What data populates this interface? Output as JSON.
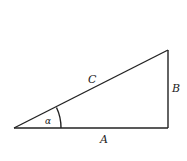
{
  "diagram": {
    "type": "right-triangle",
    "labels": {
      "hypotenuse": "C",
      "opposite": "B",
      "adjacent": "A",
      "angle": "α"
    },
    "vertices": {
      "left": [
        14,
        128
      ],
      "right_bottom": [
        168,
        128
      ],
      "right_top": [
        168,
        50
      ]
    }
  }
}
